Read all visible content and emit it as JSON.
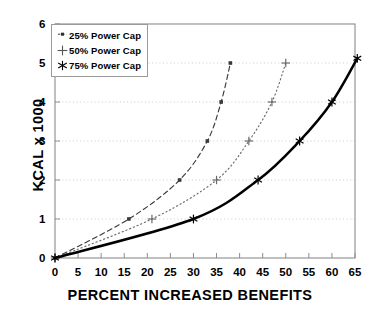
{
  "chart_data": {
    "type": "line",
    "title": "",
    "xlabel": "PERCENT INCREASED BENEFITS",
    "ylabel": "KCAL x 1000",
    "xlim": [
      0,
      65
    ],
    "ylim": [
      0,
      6
    ],
    "xticks": [
      0,
      5,
      10,
      15,
      20,
      25,
      30,
      35,
      40,
      45,
      50,
      55,
      60,
      65
    ],
    "yticks": [
      0,
      1,
      2,
      3,
      4,
      5,
      6
    ],
    "grid": "horizontal-dotted",
    "legend_position": "top-left",
    "series": [
      {
        "name": "25% Power Cap",
        "marker": "square",
        "linestyle": "dashed",
        "color": "#3a3a3a",
        "x": [
          0,
          16,
          27,
          33,
          36,
          38
        ],
        "y": [
          0,
          1,
          2,
          3,
          4,
          5
        ]
      },
      {
        "name": "50% Power Cap",
        "marker": "plus",
        "linestyle": "dotted",
        "color": "#6a6a6a",
        "x": [
          0,
          21,
          35,
          42,
          47,
          50
        ],
        "y": [
          0,
          1,
          2,
          3,
          4,
          5
        ]
      },
      {
        "name": "75% Power Cap",
        "marker": "star",
        "linestyle": "solid",
        "color": "#000000",
        "x": [
          0,
          30,
          44,
          53,
          60,
          65.5
        ],
        "y": [
          0,
          1,
          2,
          3,
          4,
          5.12
        ]
      }
    ]
  },
  "legend": {
    "items": [
      {
        "label": "25% Power Cap",
        "marker": "square-marker-icon"
      },
      {
        "label": "50% Power Cap",
        "marker": "plus-marker-icon"
      },
      {
        "label": "75% Power Cap",
        "marker": "star-marker-icon"
      }
    ]
  },
  "axis_labels": {
    "x": [
      "0",
      "5",
      "10",
      "15",
      "20",
      "25",
      "30",
      "35",
      "40",
      "45",
      "50",
      "55",
      "60",
      "65"
    ],
    "y": [
      "0",
      "1",
      "2",
      "3",
      "4",
      "5",
      "6"
    ]
  },
  "colors": {
    "frame": "#8c8c8c",
    "grid": "#c9c9c9",
    "text": "#000000",
    "series_25": "#3a3a3a",
    "series_50": "#6a6a6a",
    "series_75": "#000000"
  }
}
